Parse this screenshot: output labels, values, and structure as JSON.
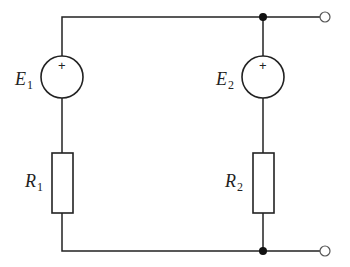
{
  "diagram": {
    "type": "circuit",
    "components": {
      "source1": {
        "symbol": "E",
        "subscript": "1",
        "polarity": "+"
      },
      "source2": {
        "symbol": "E",
        "subscript": "2",
        "polarity": "+"
      },
      "resistor1": {
        "symbol": "R",
        "subscript": "1"
      },
      "resistor2": {
        "symbol": "R",
        "subscript": "2"
      }
    },
    "terminals": [
      "top-output",
      "bottom-output"
    ],
    "junctions": [
      "top-junction",
      "bottom-junction"
    ],
    "colors": {
      "line": "#222222",
      "background": "#ffffff"
    }
  }
}
